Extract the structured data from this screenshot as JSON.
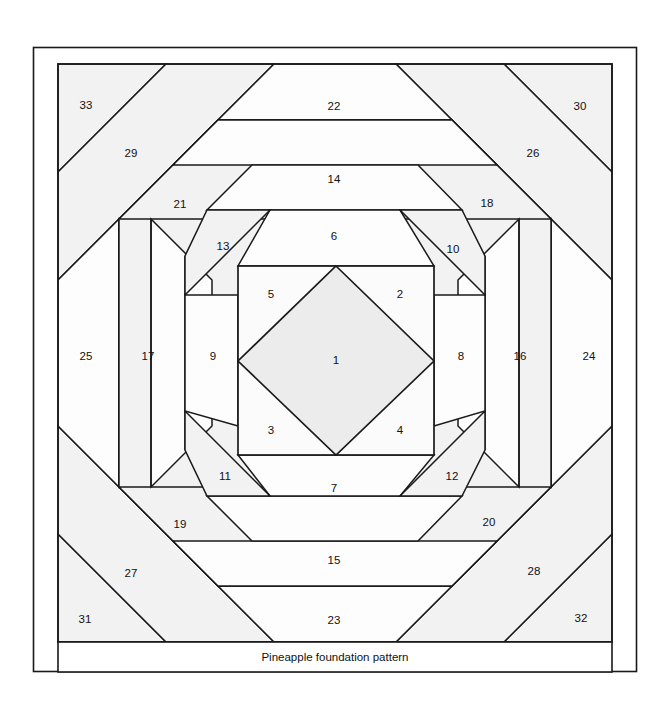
{
  "figure": {
    "title": "Pineapple foundation pattern",
    "caption": "Pineapple foundation pattern",
    "kind": "quilt-block-foundation-piecing-diagram",
    "piece_count": 33,
    "colors": {
      "background": "#ffffff",
      "outline": "#1a1a1a",
      "piece_fill_light": "#fbfbfb",
      "piece_fill_shaded": "#f0f0f0",
      "center_fill": "#ececec",
      "label_text": "#111111"
    },
    "frame": {
      "outer_border": {
        "x": 33,
        "y": 47,
        "width": 604,
        "height": 625
      },
      "pattern_block": {
        "x": 58,
        "y": 64,
        "width": 554,
        "height": 578
      },
      "caption_band": {
        "x": 58,
        "y": 642,
        "width": 554,
        "height": 30
      }
    },
    "center_square": {
      "x": 238,
      "y": 266,
      "width": 196,
      "height": 189
    }
  },
  "pieces": [
    {
      "n": "1",
      "label_x": 336,
      "label_y": 361,
      "role": "center-diamond"
    },
    {
      "n": "2",
      "label_x": 400,
      "label_y": 295,
      "role": "corner-triangle"
    },
    {
      "n": "3",
      "label_x": 271,
      "label_y": 431,
      "role": "corner-triangle"
    },
    {
      "n": "4",
      "label_x": 400,
      "label_y": 431,
      "role": "corner-triangle"
    },
    {
      "n": "5",
      "label_x": 271,
      "label_y": 295,
      "role": "corner-triangle"
    },
    {
      "n": "6",
      "label_x": 334,
      "label_y": 237,
      "role": "round1-top"
    },
    {
      "n": "7",
      "label_x": 334,
      "label_y": 489,
      "role": "round1-bottom"
    },
    {
      "n": "8",
      "label_x": 461,
      "label_y": 357,
      "role": "round1-right"
    },
    {
      "n": "9",
      "label_x": 213,
      "label_y": 357,
      "role": "round1-left"
    },
    {
      "n": "10",
      "label_x": 453,
      "label_y": 250,
      "role": "round1-corner-ne"
    },
    {
      "n": "11",
      "label_x": 225,
      "label_y": 477,
      "role": "round1-corner-sw"
    },
    {
      "n": "12",
      "label_x": 452,
      "label_y": 477,
      "role": "round1-corner-se"
    },
    {
      "n": "13",
      "label_x": 223,
      "label_y": 247,
      "role": "round1-corner-nw"
    },
    {
      "n": "14",
      "label_x": 334,
      "label_y": 180,
      "role": "round2-top"
    },
    {
      "n": "15",
      "label_x": 334,
      "label_y": 561,
      "role": "round2-bottom"
    },
    {
      "n": "16",
      "label_x": 520,
      "label_y": 357,
      "role": "round2-right"
    },
    {
      "n": "17",
      "label_x": 148,
      "label_y": 357,
      "role": "round2-left"
    },
    {
      "n": "18",
      "label_x": 487,
      "label_y": 204,
      "role": "round2-corner-ne"
    },
    {
      "n": "19",
      "label_x": 180,
      "label_y": 525,
      "role": "round2-corner-sw"
    },
    {
      "n": "20",
      "label_x": 489,
      "label_y": 523,
      "role": "round2-corner-se"
    },
    {
      "n": "21",
      "label_x": 180,
      "label_y": 205,
      "role": "round2-corner-nw"
    },
    {
      "n": "22",
      "label_x": 334,
      "label_y": 107,
      "role": "round3-top"
    },
    {
      "n": "23",
      "label_x": 334,
      "label_y": 621,
      "role": "round3-bottom"
    },
    {
      "n": "24",
      "label_x": 589,
      "label_y": 357,
      "role": "round3-right"
    },
    {
      "n": "25",
      "label_x": 86,
      "label_y": 357,
      "role": "round3-left"
    },
    {
      "n": "26",
      "label_x": 533,
      "label_y": 154,
      "role": "round3-corner-ne"
    },
    {
      "n": "27",
      "label_x": 131,
      "label_y": 574,
      "role": "round3-corner-sw"
    },
    {
      "n": "28",
      "label_x": 534,
      "label_y": 572,
      "role": "round3-corner-se"
    },
    {
      "n": "29",
      "label_x": 131,
      "label_y": 154,
      "role": "round3-corner-nw"
    },
    {
      "n": "30",
      "label_x": 580,
      "label_y": 107,
      "role": "outer-corner-ne"
    },
    {
      "n": "31",
      "label_x": 85,
      "label_y": 620,
      "role": "outer-corner-sw"
    },
    {
      "n": "32",
      "label_x": 581,
      "label_y": 619,
      "role": "outer-corner-se"
    },
    {
      "n": "33",
      "label_x": 86,
      "label_y": 106,
      "role": "outer-corner-nw"
    }
  ]
}
